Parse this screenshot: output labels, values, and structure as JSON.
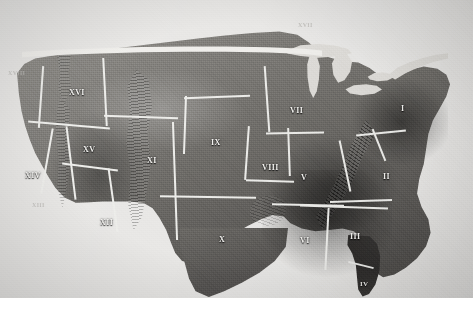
{
  "figure": {
    "kind": "halftone-photograph",
    "caption": "",
    "palette": {
      "paper": "#f2f1ef",
      "plate_light": "#e9e8e6",
      "land_light": "#8d8b86",
      "land_mid": "#6e6c68",
      "land_dark": "#3e3c3a",
      "water": "#dedcd8",
      "boundary_line": "#ededea",
      "label_text": "#f4f3f0",
      "margin_text": "#b9b7b3"
    }
  },
  "map": {
    "boundary_line_color": "#ededea",
    "regions": [
      {
        "id": "r1",
        "numeral": "I",
        "name": "region-i",
        "x": 401,
        "y": 105,
        "size": 8
      },
      {
        "id": "r2",
        "numeral": "II",
        "name": "region-ii",
        "x": 383,
        "y": 173,
        "size": 8
      },
      {
        "id": "r3",
        "numeral": "III",
        "name": "region-iii",
        "x": 350,
        "y": 233,
        "size": 8
      },
      {
        "id": "r4",
        "numeral": "IV",
        "name": "region-iv",
        "x": 360,
        "y": 281,
        "size": 7
      },
      {
        "id": "r5",
        "numeral": "V",
        "name": "region-v",
        "x": 301,
        "y": 174,
        "size": 8
      },
      {
        "id": "r6",
        "numeral": "VI",
        "name": "region-vi",
        "x": 300,
        "y": 237,
        "size": 8
      },
      {
        "id": "r7",
        "numeral": "VII",
        "name": "region-vii",
        "x": 290,
        "y": 107,
        "size": 8
      },
      {
        "id": "r8",
        "numeral": "VIII",
        "name": "region-viii",
        "x": 262,
        "y": 164,
        "size": 8
      },
      {
        "id": "r9",
        "numeral": "IX",
        "name": "region-ix",
        "x": 211,
        "y": 139,
        "size": 8
      },
      {
        "id": "r10",
        "numeral": "X",
        "name": "region-x",
        "x": 219,
        "y": 236,
        "size": 8
      },
      {
        "id": "r11",
        "numeral": "XI",
        "name": "region-xi",
        "x": 147,
        "y": 157,
        "size": 8
      },
      {
        "id": "r12",
        "numeral": "XII",
        "name": "region-xii",
        "x": 100,
        "y": 219,
        "size": 8
      },
      {
        "id": "r13",
        "numeral": "XIV",
        "name": "region-xiv",
        "x": 25,
        "y": 172,
        "size": 8
      },
      {
        "id": "r14",
        "numeral": "XV",
        "name": "region-xv",
        "x": 83,
        "y": 146,
        "size": 8
      },
      {
        "id": "r15",
        "numeral": "XVI",
        "name": "region-xvi",
        "x": 69,
        "y": 89,
        "size": 8
      }
    ],
    "margin_marks": [
      {
        "id": "m1",
        "text": "XVIII",
        "name": "margin-mark-upper-left",
        "x": 8,
        "y": 70,
        "size": 6
      },
      {
        "id": "m2",
        "text": "XIII",
        "name": "margin-mark-lower-left",
        "x": 32,
        "y": 202,
        "size": 6
      },
      {
        "id": "m3",
        "text": "XVII",
        "name": "margin-mark-canada",
        "x": 298,
        "y": 22,
        "size": 6
      }
    ],
    "water_features": [
      {
        "name": "lake-superior"
      },
      {
        "name": "lake-michigan"
      },
      {
        "name": "lake-huron"
      },
      {
        "name": "lake-erie"
      },
      {
        "name": "lake-ontario"
      },
      {
        "name": "st-lawrence-river"
      }
    ]
  }
}
